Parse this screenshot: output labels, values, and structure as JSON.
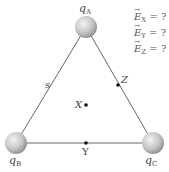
{
  "diagram": {
    "charges": [
      {
        "name": "q",
        "sub": "A"
      },
      {
        "name": "q",
        "sub": "B"
      },
      {
        "name": "q",
        "sub": "C"
      }
    ],
    "side_label": "s",
    "points": [
      {
        "label": "X"
      },
      {
        "label": "Y"
      },
      {
        "label": "Z"
      }
    ],
    "questions": [
      {
        "symbol": "E",
        "sub": "X",
        "rest": " = ?"
      },
      {
        "symbol": "E",
        "sub": "Y",
        "rest": " = ?"
      },
      {
        "symbol": "E",
        "sub": "Z",
        "rest": " = ?"
      }
    ],
    "colors": {
      "line": "#666666",
      "sphere_light": "#f4f4f4",
      "sphere_dark": "#8a8a8a",
      "dot": "#111111"
    }
  }
}
